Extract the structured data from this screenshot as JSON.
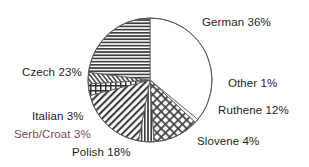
{
  "chart_data": {
    "type": "pie",
    "title": "",
    "subtitle": "",
    "xlabel": "",
    "ylabel": "",
    "legend_position": "none",
    "grid": false,
    "units": "percent",
    "total": 100,
    "start_angle_deg": 0,
    "direction": "clockwise",
    "categories": [
      "German",
      "Other",
      "Ruthene",
      "Slovene",
      "Polish",
      "Serb/Croat",
      "Italian",
      "Czech"
    ],
    "values": [
      36,
      1,
      12,
      4,
      18,
      3,
      3,
      23
    ],
    "slices": [
      {
        "name": "German",
        "value": 36,
        "label": "German 36%",
        "pattern": "solid-white",
        "start_deg": 0,
        "end_deg": 129.6,
        "label_x": 202,
        "label_y": 16
      },
      {
        "name": "Other",
        "value": 1,
        "label": "Other 1%",
        "pattern": "solid-white",
        "start_deg": 129.6,
        "end_deg": 133.2,
        "label_x": 228,
        "label_y": 77
      },
      {
        "name": "Ruthene",
        "value": 12,
        "label": "Ruthene 12%",
        "pattern": "diagonal-crosshatch",
        "start_deg": 133.2,
        "end_deg": 176.4,
        "label_x": 218,
        "label_y": 104
      },
      {
        "name": "Slovene",
        "value": 4,
        "label": "Slovene 4%",
        "pattern": "vertical-lines",
        "start_deg": 176.4,
        "end_deg": 190.8,
        "label_x": 197,
        "label_y": 135
      },
      {
        "name": "Polish",
        "value": 18,
        "label": "Polish 18%",
        "pattern": "diagonal-lines",
        "start_deg": 190.8,
        "end_deg": 255.6,
        "label_x": 72,
        "label_y": 146
      },
      {
        "name": "Serb/Croat",
        "value": 3,
        "label": "Serb/Croat 3%",
        "pattern": "square-grid",
        "start_deg": 255.6,
        "end_deg": 266.4,
        "label_x": 14,
        "label_y": 128
      },
      {
        "name": "Italian",
        "value": 3,
        "label": "Italian 3%",
        "pattern": "fine-diagonal",
        "start_deg": 266.4,
        "end_deg": 277.2,
        "label_x": 32,
        "label_y": 110
      },
      {
        "name": "Czech",
        "value": 23,
        "label": "Czech 23%",
        "pattern": "horizontal-lines",
        "start_deg": 277.2,
        "end_deg": 360,
        "label_x": 22,
        "label_y": 66
      }
    ],
    "geometry": {
      "center_x": 150,
      "center_y": 80,
      "radius": 62
    },
    "colors": {
      "background": "#ffffff",
      "outline": "#555555",
      "pattern_stroke": "#3a3a3a",
      "label_text": "#1e1e1e",
      "tinted_label_text": "#7d4b4b"
    }
  }
}
